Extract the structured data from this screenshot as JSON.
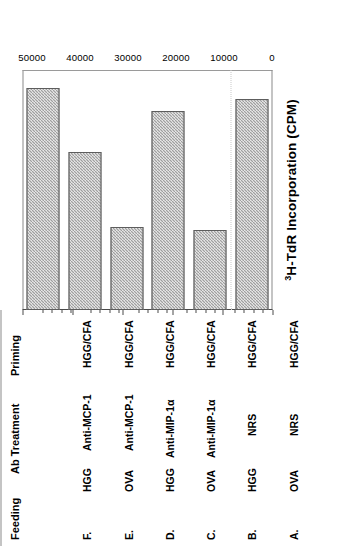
{
  "figure": {
    "axis_title_prefix": "3",
    "axis_title": "H-TdR Incorporation (CPM)"
  },
  "table": {
    "headers": [
      "Feeding",
      "Ab Treatment",
      "Priming"
    ],
    "rows": [
      {
        "id": "A.",
        "feeding": "OVA",
        "ab_treatment": "NRS",
        "priming": "HGG/CFA"
      },
      {
        "id": "B.",
        "feeding": "HGG",
        "ab_treatment": "NRS",
        "priming": "HGG/CFA"
      },
      {
        "id": "C.",
        "feeding": "OVA",
        "ab_treatment": "Anti-MIP-1α",
        "priming": "HGG/CFA"
      },
      {
        "id": "D.",
        "feeding": "HGG",
        "ab_treatment": "Anti-MIP-1α",
        "priming": "HGG/CFA"
      },
      {
        "id": "E.",
        "feeding": "OVA",
        "ab_treatment": "Anti-MCP-1",
        "priming": "HGG/CFA"
      },
      {
        "id": "F.",
        "feeding": "HGG",
        "ab_treatment": "Anti-MCP-1",
        "priming": "HGG/CFA"
      }
    ]
  },
  "chart_data": {
    "type": "bar",
    "orientation": "horizontal",
    "title": "",
    "xlabel": "3H-TdR Incorporation (CPM)",
    "ylabel": "",
    "categories": [
      "A.",
      "B.",
      "C.",
      "D.",
      "E.",
      "F."
    ],
    "values": [
      44000,
      16700,
      41500,
      17300,
      33000,
      46200
    ],
    "xlim": [
      0,
      50000
    ],
    "ticks": [
      0,
      10000,
      20000,
      30000,
      40000,
      50000
    ],
    "tick_labels": [
      "0",
      "10000",
      "20000",
      "30000",
      "40000",
      "50000"
    ],
    "minor_tick_interval": 2000,
    "grid": true,
    "gridlines": [
      8500
    ],
    "legend": null,
    "bar_color": "#9f9f9f",
    "bar_pattern": "checker-hatch"
  }
}
